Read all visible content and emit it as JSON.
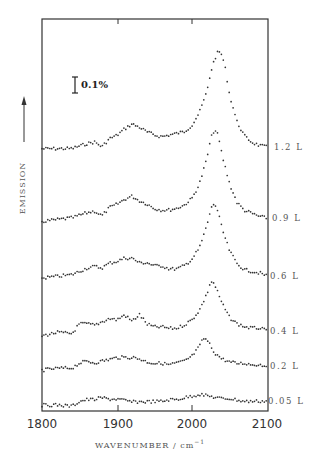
{
  "chart_data": {
    "type": "scatter",
    "title": "",
    "xlabel": "WAVENUMBER / cm⁻¹",
    "ylabel": "EMISSION",
    "xlim": [
      1800,
      2100
    ],
    "x_ticks": [
      1800,
      1900,
      2000,
      2100
    ],
    "x_tick_labels": [
      "1800",
      "1900",
      "2000",
      "2100"
    ],
    "grid": false,
    "legend": "inline labels at right edge",
    "scale_bar": {
      "label": "0.1%",
      "units": "emission"
    },
    "y_units_note": "curves vertically offset; intensities in % relative to scale bar (0.1% bar)",
    "series": [
      {
        "name": "1.2 L",
        "offset_rank": 6,
        "x": [
          1800,
          1820,
          1840,
          1860,
          1870,
          1880,
          1890,
          1900,
          1910,
          1920,
          1930,
          1940,
          1950,
          1960,
          1970,
          1980,
          1990,
          2000,
          2010,
          2020,
          2025,
          2030,
          2035,
          2040,
          2045,
          2050,
          2060,
          2070,
          2080,
          2090,
          2100
        ],
        "y": [
          0.0,
          0.0,
          0.0,
          0.03,
          0.04,
          0.01,
          0.06,
          0.08,
          0.12,
          0.15,
          0.13,
          0.1,
          0.08,
          0.07,
          0.08,
          0.09,
          0.1,
          0.14,
          0.22,
          0.35,
          0.47,
          0.55,
          0.6,
          0.58,
          0.48,
          0.33,
          0.16,
          0.07,
          0.03,
          0.01,
          0.0
        ]
      },
      {
        "name": "0.9 L",
        "offset_rank": 5,
        "x": [
          1800,
          1820,
          1840,
          1860,
          1870,
          1880,
          1890,
          1900,
          1910,
          1920,
          1930,
          1940,
          1950,
          1960,
          1970,
          1980,
          1990,
          2000,
          2010,
          2020,
          2025,
          2030,
          2035,
          2040,
          2050,
          2060,
          2070,
          2080,
          2090,
          2100
        ],
        "y": [
          0.0,
          0.01,
          0.02,
          0.05,
          0.06,
          0.03,
          0.08,
          0.1,
          0.13,
          0.15,
          0.12,
          0.1,
          0.07,
          0.06,
          0.06,
          0.07,
          0.09,
          0.13,
          0.22,
          0.38,
          0.5,
          0.56,
          0.52,
          0.4,
          0.22,
          0.1,
          0.05,
          0.03,
          0.01,
          0.0
        ]
      },
      {
        "name": "0.6 L",
        "offset_rank": 4,
        "x": [
          1800,
          1820,
          1840,
          1860,
          1870,
          1880,
          1890,
          1900,
          1910,
          1920,
          1930,
          1940,
          1950,
          1960,
          1970,
          1980,
          1990,
          2000,
          2010,
          2020,
          2025,
          2030,
          2035,
          2040,
          2050,
          2060,
          2070,
          2080,
          2090,
          2100
        ],
        "y": [
          0.0,
          0.01,
          0.02,
          0.06,
          0.07,
          0.06,
          0.09,
          0.1,
          0.12,
          0.12,
          0.09,
          0.09,
          0.07,
          0.07,
          0.05,
          0.05,
          0.07,
          0.11,
          0.18,
          0.32,
          0.42,
          0.46,
          0.4,
          0.3,
          0.16,
          0.08,
          0.04,
          0.03,
          0.02,
          0.0
        ]
      },
      {
        "name": "0.4 L",
        "offset_rank": 3,
        "x": [
          1800,
          1820,
          1840,
          1850,
          1860,
          1870,
          1880,
          1890,
          1900,
          1910,
          1920,
          1930,
          1940,
          1950,
          1960,
          1970,
          1980,
          1990,
          2000,
          2010,
          2020,
          2025,
          2030,
          2040,
          2050,
          2060,
          2070,
          2080,
          2090,
          2100
        ],
        "y": [
          0.0,
          0.02,
          0.01,
          0.07,
          0.07,
          0.06,
          0.08,
          0.1,
          0.09,
          0.12,
          0.08,
          0.12,
          0.06,
          0.04,
          0.04,
          0.03,
          0.03,
          0.05,
          0.08,
          0.14,
          0.24,
          0.32,
          0.3,
          0.18,
          0.09,
          0.05,
          0.03,
          0.02,
          0.02,
          0.0
        ]
      },
      {
        "name": "0.2 L",
        "offset_rank": 2,
        "x": [
          1800,
          1820,
          1840,
          1850,
          1860,
          1870,
          1880,
          1890,
          1900,
          1910,
          1920,
          1930,
          1940,
          1950,
          1960,
          1970,
          1980,
          1990,
          2000,
          2010,
          2015,
          2020,
          2030,
          2040,
          2050,
          2060,
          2070,
          2080,
          2090,
          2100
        ],
        "y": [
          0.0,
          0.01,
          0.01,
          0.04,
          0.05,
          0.04,
          0.05,
          0.06,
          0.07,
          0.07,
          0.07,
          0.06,
          0.04,
          0.03,
          0.03,
          0.02,
          0.03,
          0.04,
          0.07,
          0.13,
          0.18,
          0.17,
          0.09,
          0.05,
          0.03,
          0.02,
          0.02,
          0.01,
          0.01,
          0.0
        ]
      },
      {
        "name": "0.05 L",
        "offset_rank": 1,
        "x": [
          1800,
          1820,
          1840,
          1850,
          1860,
          1870,
          1880,
          1890,
          1900,
          1910,
          1920,
          1930,
          1940,
          1950,
          1960,
          1970,
          1980,
          1990,
          2000,
          2010,
          2020,
          2030,
          2040,
          2050,
          2060,
          2070,
          2080,
          2090,
          2100
        ],
        "y": [
          0.0,
          0.0,
          -0.01,
          0.02,
          0.03,
          0.03,
          0.04,
          0.03,
          0.03,
          0.02,
          0.01,
          0.01,
          0.01,
          0.01,
          0.01,
          0.02,
          0.02,
          0.03,
          0.04,
          0.05,
          0.04,
          0.03,
          0.02,
          0.02,
          0.01,
          0.0,
          0.0,
          0.0,
          0.0
        ]
      }
    ]
  },
  "plot": {
    "x_tick_labels": [
      "1800",
      "1900",
      "2000",
      "2100"
    ],
    "xlabel_main": "WAVENUMBER / cm",
    "xlabel_sup": "−1",
    "ylabel": "EMISSION",
    "scale_bar_label": "0.1%",
    "series_labels": [
      "1.2 L",
      "0.9 L",
      "0.6 L",
      "0.4 L",
      "0.2 L",
      "0.05 L"
    ]
  }
}
